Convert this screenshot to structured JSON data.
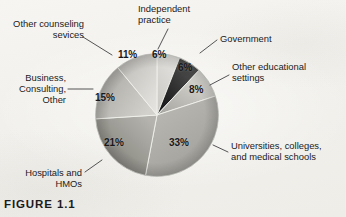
{
  "figure": {
    "caption": "FIGURE 1.1",
    "background_color": "#f3f2ee"
  },
  "chart_data": {
    "type": "pie",
    "title": "",
    "subtitle": "",
    "xlabel": "",
    "ylabel": "",
    "grid": false,
    "legend_position": "callout-labels",
    "units": "percent",
    "total": 100,
    "start_angle_deg": 0,
    "direction": "clockwise",
    "categories": [
      "Independent practice",
      "Government",
      "Other educational settings",
      "Universities, colleges, and medical schools",
      "Hospitals and HMOs",
      "Business, Consulting, Other",
      "Other counseling sevices"
    ],
    "values": [
      6,
      6,
      8,
      33,
      21,
      15,
      11
    ],
    "slices": [
      {
        "label": "Independent practice",
        "label_display": "Independent\npractice",
        "value": 6,
        "value_label": "6%",
        "color": "#d9d8d4",
        "color_dark": "#c3c2bd",
        "start_deg": 0,
        "end_deg": 21.6
      },
      {
        "label": "Government",
        "label_display": "Government",
        "value": 6,
        "value_label": "6%",
        "color": "#3a3a3c",
        "color_dark": "#16161a",
        "start_deg": 21.6,
        "end_deg": 43.2
      },
      {
        "label": "Other educational settings",
        "label_display": "Other educational\nsettings",
        "value": 8,
        "value_label": "8%",
        "color": "#cfcec9",
        "color_dark": "#a8a7a2",
        "start_deg": 43.2,
        "end_deg": 72.0
      },
      {
        "label": "Universities, colleges, and medical schools",
        "label_display": "Universities, colleges,\nand medical schools",
        "value": 33,
        "value_label": "33%",
        "color": "#b3b2ad",
        "color_dark": "#9a9994",
        "start_deg": 72.0,
        "end_deg": 190.8
      },
      {
        "label": "Hospitals and HMOs",
        "label_display": "Hospitals and\nHMOs",
        "value": 21,
        "value_label": "21%",
        "color": "#a6a5a0",
        "color_dark": "#7e7d79",
        "start_deg": 190.8,
        "end_deg": 266.4
      },
      {
        "label": "Business, Consulting, Other",
        "label_display": "Business,\nConsulting,\nOther",
        "value": 15,
        "value_label": "15%",
        "color": "#c9c8c3",
        "color_dark": "#a3a29d",
        "start_deg": 266.4,
        "end_deg": 320.4
      },
      {
        "label": "Other counseling sevices",
        "label_display": "Other counseling\nsevices",
        "value": 11,
        "value_label": "11%",
        "color": "#dedcd8",
        "color_dark": "#bab9b4",
        "start_deg": 320.4,
        "end_deg": 360.0
      }
    ]
  }
}
